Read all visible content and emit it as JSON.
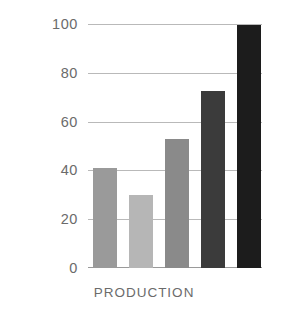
{
  "chart_data": {
    "type": "bar",
    "title": "",
    "subtitle": "",
    "xlabel": "PRODUCTION",
    "ylabel": "",
    "categories": [
      "1",
      "2",
      "3",
      "4",
      "5"
    ],
    "values": [
      41,
      30,
      53,
      73,
      100
    ],
    "series": [
      {
        "name": "Production",
        "values": [
          41,
          30,
          53,
          73,
          100
        ]
      }
    ],
    "bar_colors": [
      "#9a9a9a",
      "#b6b6b6",
      "#8a8a8a",
      "#3b3b3b",
      "#1c1c1c"
    ],
    "ylim": [
      0,
      100
    ],
    "xlim": [
      0,
      5
    ],
    "ytick_labels": [
      "0",
      "20",
      "40",
      "60",
      "80",
      "100"
    ],
    "ytick_values": [
      0,
      20,
      40,
      60,
      80,
      100
    ],
    "xtick_labels": [],
    "grid": true,
    "grid_axis": "y",
    "grid_color": "#b9b9b9",
    "axis_color": "#9a9a9a",
    "legend": false,
    "legend_position": "none",
    "background_color": "#ffffff",
    "text_color": "#6b6b6b",
    "annotations": []
  },
  "axis": {
    "x_label_text": "PRODUCTION"
  }
}
